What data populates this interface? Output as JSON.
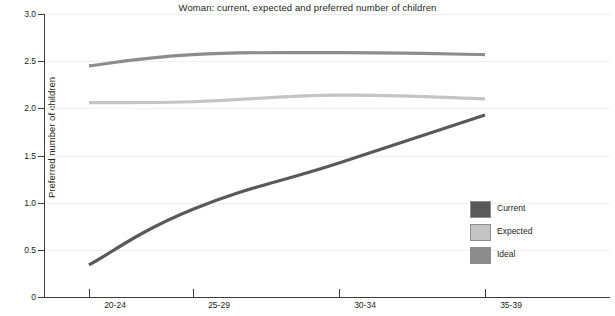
{
  "chart_data": {
    "type": "line",
    "title": "Woman: current, expected and preferred number of children",
    "xlabel": "",
    "ylabel": "Preferred number of children",
    "categories": [
      "20-24",
      "25-29",
      "30-34",
      "35-39"
    ],
    "ylim": [
      0,
      3.0
    ],
    "yticks": [
      "0",
      "0.5",
      "1.0",
      "1.5",
      "2.0",
      "2.5",
      "3.0"
    ],
    "ytick_values": [
      0,
      0.5,
      1.0,
      1.5,
      2.0,
      2.5,
      3.0
    ],
    "grid": true,
    "legend_position": "center-right",
    "series": [
      {
        "name": "Current",
        "values": [
          0.34,
          0.93,
          1.42,
          1.93
        ],
        "color": "#595959"
      },
      {
        "name": "Expected",
        "values": [
          2.06,
          2.07,
          2.14,
          2.1
        ],
        "color": "#c4c4c4"
      },
      {
        "name": "Ideal",
        "values": [
          2.45,
          2.57,
          2.59,
          2.57
        ],
        "color": "#8c8c8c"
      }
    ]
  },
  "legend": {
    "items": [
      {
        "label": "Current",
        "color": "#595959"
      },
      {
        "label": "Expected",
        "color": "#c4c4c4"
      },
      {
        "label": "Ideal",
        "color": "#8c8c8c"
      }
    ]
  },
  "colors": {
    "background": "#ffffff",
    "axis": "#3b3b3b",
    "gridline": "#efefef",
    "text": "#231f20"
  }
}
